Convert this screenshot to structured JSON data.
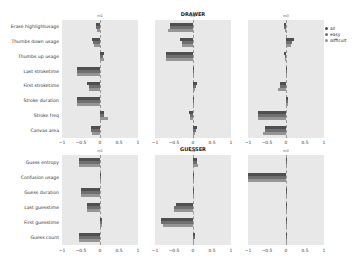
{
  "chart_data": [
    {
      "type": "bar",
      "orientation": "horizontal",
      "row_title": "DRAWER",
      "panels": [
        {
          "title": "m1",
          "values": {
            "all": [
              -0.1,
              -0.2,
              0.1,
              -0.6,
              -0.35,
              -0.6,
              0.1,
              -0.25
            ],
            "easy": [
              -0.1,
              -0.18,
              0.08,
              -0.6,
              -0.3,
              -0.6,
              0.1,
              -0.25
            ],
            "difficult": [
              -0.08,
              -0.15,
              0.1,
              -0.6,
              -0.3,
              -0.6,
              0.2,
              -0.2
            ]
          }
        },
        {
          "title": "m2",
          "values": {
            "all": [
              -0.6,
              -0.35,
              -0.7,
              0.0,
              0.1,
              0.0,
              -0.1,
              0.1
            ],
            "easy": [
              -0.6,
              -0.3,
              -0.7,
              0.0,
              0.08,
              0.0,
              -0.08,
              0.08
            ],
            "difficult": [
              -0.65,
              -0.3,
              -0.7,
              0.0,
              0.05,
              0.0,
              -0.08,
              0.06
            ]
          }
        },
        {
          "title": "m3",
          "values": {
            "all": [
              -0.05,
              0.2,
              -0.04,
              0.01,
              -0.15,
              0.05,
              -0.75,
              -0.55
            ],
            "easy": [
              -0.04,
              0.15,
              -0.03,
              0.01,
              -0.15,
              0.04,
              -0.75,
              -0.55
            ],
            "difficult": [
              -0.03,
              0.12,
              -0.02,
              0.01,
              -0.22,
              0.04,
              -0.75,
              -0.6
            ]
          }
        }
      ],
      "categories": [
        "Erase highlightusage",
        "Thumbs down usage",
        "Thumbs up usage",
        "Last stroketime",
        "First stroketime",
        "Stroke duration",
        "Stroke freq",
        "Canvas area"
      ],
      "xlim": [
        -1,
        1
      ],
      "xticks": [
        "−1",
        "−0.5",
        "0",
        "0.5",
        "1"
      ]
    },
    {
      "type": "bar",
      "orientation": "horizontal",
      "row_title": "GUESSER",
      "panels": [
        {
          "title": "m1",
          "values": {
            "all": [
              -0.55,
              0.0,
              -0.5,
              -0.35,
              0.05,
              -0.55
            ],
            "easy": [
              -0.55,
              0.0,
              -0.5,
              -0.33,
              0.04,
              -0.55
            ],
            "difficult": [
              -0.55,
              0.0,
              -0.5,
              -0.33,
              0.04,
              -0.55
            ]
          }
        },
        {
          "title": "m2",
          "values": {
            "all": [
              0.1,
              0.0,
              0.02,
              -0.45,
              -0.85,
              0.05
            ],
            "easy": [
              0.1,
              0.0,
              0.02,
              -0.5,
              -0.85,
              0.05
            ],
            "difficult": [
              0.12,
              0.0,
              0.02,
              -0.5,
              -0.8,
              0.03
            ]
          }
        },
        {
          "title": "m3",
          "values": {
            "all": [
              0.01,
              -1.0,
              0.01,
              0.01,
              0.01,
              0.01
            ],
            "easy": [
              0.01,
              -1.0,
              0.01,
              0.01,
              0.01,
              0.01
            ],
            "difficult": [
              0.01,
              -1.0,
              0.01,
              0.01,
              0.01,
              0.01
            ]
          }
        }
      ],
      "categories": [
        "Guess entropy",
        "Confusion usage",
        "Guess duration",
        "Last guesstime",
        "First guesstime",
        "Guess count"
      ],
      "xlim": [
        -1,
        1
      ],
      "xticks": [
        "−1",
        "−0.5",
        "0",
        "0.5",
        "1"
      ]
    }
  ],
  "legend": [
    {
      "name": "all",
      "color": "#4f4f4f"
    },
    {
      "name": "easy",
      "color": "#6f6f6f"
    },
    {
      "name": "difficult",
      "color": "#959595"
    }
  ]
}
